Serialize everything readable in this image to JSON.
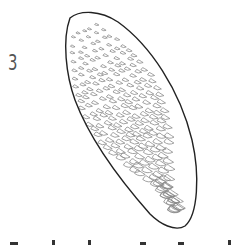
{
  "figure": {
    "label": "3",
    "outline_color": "#222222",
    "scale_color": "#8a8a8a"
  }
}
